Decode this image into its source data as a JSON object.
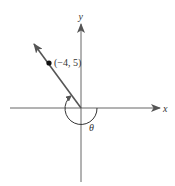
{
  "diagram": {
    "type": "angle-in-standard-position",
    "axes": {
      "x_label": "x",
      "y_label": "y"
    },
    "point": {
      "label": "(−4, 5)",
      "x": -4,
      "y": 5
    },
    "angle": {
      "label": "θ",
      "direction": "clockwise",
      "initial_side": "positive x-axis",
      "terminal_side": "ray through (−4, 5)"
    },
    "colors": {
      "line": "#555555",
      "text": "#333333",
      "background": "#ffffff"
    }
  }
}
